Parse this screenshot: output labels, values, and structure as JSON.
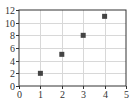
{
  "chart_data": {
    "type": "scatter",
    "title": "",
    "xlabel": "",
    "ylabel": "",
    "xlim": [
      0,
      5
    ],
    "ylim": [
      0,
      12
    ],
    "grid": true,
    "legend": null,
    "x_ticks": [
      0,
      1,
      2,
      3,
      4,
      5
    ],
    "y_ticks": [
      0,
      2,
      4,
      6,
      8,
      10,
      12
    ],
    "x_tick_labels": [
      "0",
      "1",
      "2",
      "3",
      "4",
      "5"
    ],
    "y_tick_labels": [
      "0",
      "2",
      "4",
      "6",
      "8",
      "10",
      "12"
    ],
    "series": [
      {
        "name": "data",
        "marker": "square",
        "color": "#444444",
        "points": [
          {
            "x": 1,
            "y": 2
          },
          {
            "x": 2,
            "y": 5
          },
          {
            "x": 3,
            "y": 8
          },
          {
            "x": 4,
            "y": 11
          }
        ]
      }
    ]
  },
  "colors": {
    "axis": "#333333",
    "grid": "#d8d8d8",
    "marker": "#444444"
  }
}
